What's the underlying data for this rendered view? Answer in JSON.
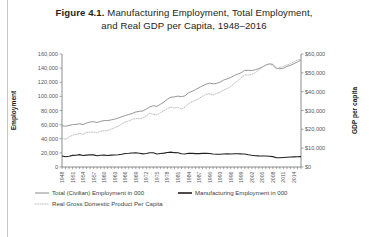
{
  "figure": {
    "number": "Figure 4.1.",
    "title_line1": "Manufacturing Employment, Total Employment,",
    "title_line2": "and Real GDP per Capita, 1948–2016"
  },
  "chart_data": {
    "type": "line",
    "title": "Figure 4.1. Manufacturing Employment, Total Employment, and Real GDP per Capita, 1948–2016",
    "xlabel": "",
    "ylabel": "Employment",
    "y2label": "GDP per capita",
    "grid": false,
    "legend_position": "bottom-left",
    "xlim": [
      1948,
      2016
    ],
    "ylim": [
      0,
      160000
    ],
    "y2lim": [
      0,
      60000
    ],
    "yticks": [
      "0",
      "20,000",
      "40,000",
      "60,000",
      "80,000",
      "100,000",
      "120,000",
      "140,000",
      "160,000"
    ],
    "ytick_values": [
      0,
      20000,
      40000,
      60000,
      80000,
      100000,
      120000,
      140000,
      160000
    ],
    "y2ticks": [
      "$0",
      "$10,000",
      "$20,000",
      "$30,000",
      "$40,000",
      "$50,000",
      "$60,000"
    ],
    "y2tick_values": [
      0,
      10000,
      20000,
      30000,
      40000,
      50000,
      60000
    ],
    "xtick_labels": [
      "1948",
      "1951",
      "1954",
      "1957",
      "1960",
      "1963",
      "1966",
      "1969",
      "1972",
      "1975",
      "1978",
      "1981",
      "1984",
      "1987",
      "1990",
      "1993",
      "1996",
      "1999",
      "2002",
      "2005",
      "2008",
      "2011",
      "2014"
    ],
    "xtick_values": [
      1948,
      1951,
      1954,
      1957,
      1960,
      1963,
      1966,
      1969,
      1972,
      1975,
      1978,
      1981,
      1984,
      1987,
      1990,
      1993,
      1996,
      1999,
      2002,
      2005,
      2008,
      2011,
      2014
    ],
    "x": [
      1948,
      1949,
      1950,
      1951,
      1952,
      1953,
      1954,
      1955,
      1956,
      1957,
      1958,
      1959,
      1960,
      1961,
      1962,
      1963,
      1964,
      1965,
      1966,
      1967,
      1968,
      1969,
      1970,
      1971,
      1972,
      1973,
      1974,
      1975,
      1976,
      1977,
      1978,
      1979,
      1980,
      1981,
      1982,
      1983,
      1984,
      1985,
      1986,
      1987,
      1988,
      1989,
      1990,
      1991,
      1992,
      1993,
      1994,
      1995,
      1996,
      1997,
      1998,
      1999,
      2000,
      2001,
      2002,
      2003,
      2004,
      2005,
      2006,
      2007,
      2008,
      2009,
      2010,
      2011,
      2012,
      2013,
      2014,
      2015,
      2016
    ],
    "series": [
      {
        "name": "Total (Civilian) Employment in 000",
        "axis": "left",
        "style": "solid-gray",
        "values": [
          58343,
          57651,
          58918,
          59961,
          60250,
          61179,
          60109,
          62170,
          63799,
          64071,
          63036,
          64630,
          65778,
          65746,
          66702,
          67762,
          69305,
          71088,
          72895,
          74372,
          75920,
          77902,
          78678,
          79367,
          82153,
          85064,
          86794,
          85846,
          88752,
          92017,
          96048,
          98824,
          99303,
          100397,
          99526,
          100834,
          105005,
          107150,
          109597,
          112440,
          114968,
          117342,
          118793,
          117718,
          118492,
          120259,
          123060,
          124900,
          126708,
          129558,
          131463,
          133488,
          136891,
          136933,
          136485,
          137736,
          139252,
          141730,
          144427,
          146047,
          145362,
          139877,
          139064,
          139869,
          142469,
          143929,
          146305,
          148834,
          151436
        ]
      },
      {
        "name": "Manufacturing Employment in 000",
        "axis": "left",
        "style": "solid-black",
        "values": [
          15582,
          14441,
          15241,
          16393,
          16632,
          17549,
          16314,
          16882,
          17243,
          17174,
          15945,
          16675,
          16796,
          16326,
          16853,
          16995,
          17274,
          18062,
          19214,
          19447,
          19781,
          20167,
          19367,
          18623,
          19151,
          20154,
          20077,
          18323,
          18997,
          19682,
          20505,
          21040,
          20285,
          20170,
          18780,
          18432,
          19372,
          19248,
          18947,
          18999,
          19314,
          19391,
          19076,
          18406,
          18104,
          18075,
          18321,
          18524,
          18495,
          18675,
          18805,
          18574,
          18469,
          17372,
          16577,
          15926,
          15694,
          15657,
          15525,
          15275,
          14714,
          13131,
          13160,
          13483,
          13838,
          14071,
          14341,
          14536,
          14649
        ]
      },
      {
        "name": "Real Gross Domestic Product Per Capita",
        "axis": "right",
        "style": "dotted",
        "values": [
          15100,
          14800,
          15900,
          16900,
          17300,
          17800,
          17400,
          18400,
          18500,
          18600,
          18100,
          19100,
          19200,
          19300,
          20200,
          20800,
          21700,
          22800,
          24000,
          24400,
          25300,
          25800,
          25600,
          26100,
          27200,
          28500,
          28000,
          27600,
          28800,
          29800,
          31100,
          31800,
          31300,
          31800,
          30700,
          31700,
          33700,
          34700,
          35500,
          36400,
          37600,
          38600,
          38900,
          38200,
          39000,
          39700,
          40900,
          41600,
          42800,
          44300,
          45800,
          47400,
          48900,
          48800,
          49100,
          50100,
          51600,
          53000,
          54100,
          54600,
          53800,
          52000,
          52900,
          53300,
          54200,
          54800,
          55900,
          56800,
          57100
        ]
      }
    ],
    "legend": [
      {
        "label": "Total (Civilian) Employment in 000",
        "style": "solid-gray",
        "color": "#8a8a8a"
      },
      {
        "label": "Manufacturing Employment in 000",
        "style": "solid-black",
        "color": "#231f20"
      },
      {
        "label": "Real Gross Domestic Product Per Capita",
        "style": "dotted",
        "color": "#c2c2c2"
      }
    ]
  }
}
